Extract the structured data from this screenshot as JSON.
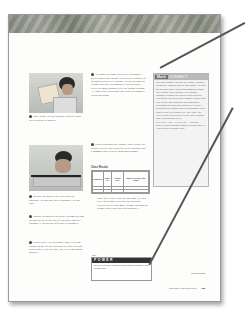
{
  "page": {
    "steps": {
      "step4": {
        "num": "4",
        "text": "Pour 100 mL of your substance into the beaker. Be as accurate as possible."
      },
      "step5": {
        "num": "5",
        "text": "Measure the mass of the beaker plus the substance. Record this value in column C in your table."
      },
      "step6": {
        "num": "6",
        "text": "Subtract the mass of the beaker (column B) from the mass of the beaker and the substance together (column C). Record the difference in column D."
      },
      "step7": {
        "num": "7",
        "text": "Repeat steps 3 to 5 four more times, each time adding 100 mL of your substance to what is already in the beaker. (The last time, you will be measuring 500 mL.)"
      },
      "step8": {
        "num": "8",
        "text": "The mass-to-volume ratio is the relationship between mass and volume expressed as a quantity of the mass divided by its volume. To find the mass-to-volume ratio for each amount of each substance, divide the mass (column D) by the volume (column A). Show your calculations and results in column E. Wash your hands."
      },
      "step9": {
        "num": "9",
        "text": "When each group has finished, your teacher will display a set of class results for all the substances on a common chart with the following headings:"
      }
    },
    "class_results": {
      "title": "Class Results",
      "headers": [
        "Substance",
        "Mass (g)",
        "Volume (mL)",
        "Mass-to-volume ratio (g/mL)"
      ],
      "rows": [
        [
          "",
          "",
          "",
          ""
        ],
        [
          "",
          "",
          "",
          ""
        ]
      ]
    },
    "copy_text": "Copy these results into your notebook. (If there were two or more trials for each substance, calculate the average mass, volume, and mass-to-volume ratio values for each substance.)",
    "math_connect": {
      "tag": "Math",
      "title": "CONNECT",
      "text": "The ratio \"mass to volume\" (or \"mass : volume\") means the \"mass divided by the volume.\" To find the decimal value, convert the fraction of mass over volume into a decimal. For example, suppose a mass of 5 g has a volume of 8 mL. How would you convert the mass-to-volume ratio (5 g : 8 mL) into a decimal value? Begin by expressing the ratio as a fraction: 5 g / 8 mL. A decimal is any fraction with a denominator of any power of 10, for example, 10, 100, 1000, etc. Here is how to convert 5 g / 8 mL into a fraction with a denominator of 10:",
      "equation": "5 g / 8 mL = 5/8 = 0.6 g / 1 mL = 0.6 g/mL",
      "after": "Now, try converting the mass-to-volume ratio 9 g : 20 mL into a decimal value."
    },
    "skill_power": {
      "label": "Skill",
      "title": "POWER",
      "text": "To review how to measure mass using a balance, turn to page 500."
    },
    "footer": {
      "continued": "CONTINUED",
      "section": "Chemistry and Resources",
      "page_number": "135"
    }
  }
}
